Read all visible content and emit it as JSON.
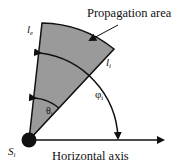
{
  "labels": {
    "area": "Propagation area",
    "le": "l",
    "le_sub": "e",
    "li": "l",
    "li_sub": "i",
    "theta": "θ",
    "theta_sub": "i",
    "phi": "φ",
    "phi_sub": "i",
    "source": "S",
    "source_sub": "i",
    "axis": "Horizontal axis"
  },
  "colors": {
    "sector_fill": "#9a9a9a",
    "stroke": "#111111"
  }
}
